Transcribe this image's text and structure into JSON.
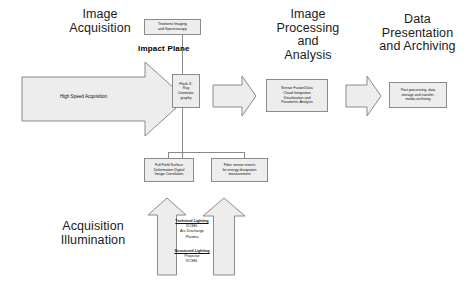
{
  "diagram": {
    "colors": {
      "shape_fill": "#ededed",
      "shape_stroke": "#8a8a8a",
      "text": "#111111",
      "background": "#ffffff"
    },
    "headings": [
      {
        "id": "image-acquisition",
        "lines": [
          "Image",
          "Acquisition"
        ]
      },
      {
        "id": "image-processing-analysis",
        "lines": [
          "Image",
          "Processing",
          "and",
          "Analysis"
        ]
      },
      {
        "id": "data-presentation-archiving",
        "lines": [
          "Data",
          "Presentation",
          "and Archiving"
        ]
      },
      {
        "id": "acquisition-illumination",
        "lines": [
          "Acquisition",
          "Illumination"
        ]
      }
    ],
    "main_arrow": {
      "label": "High Speed Acquisition"
    },
    "impact_plane": {
      "label": "Impact Plane"
    },
    "boxes": [
      {
        "id": "terahertz",
        "lines": [
          "Terahertz Imaging",
          "and Spectroscopy"
        ]
      },
      {
        "id": "flash-xray",
        "lines": [
          "Flash X-",
          "Ray",
          "Cinemato-",
          "graphy"
        ]
      },
      {
        "id": "sensor-fusion",
        "lines": [
          "Sensor Fusion/Data",
          "Cloud Integration",
          "Visualization and",
          "Parametric Analysis"
        ]
      },
      {
        "id": "post-processing",
        "lines": [
          "Post processing, data",
          "storage and transfer,",
          "media archiving"
        ]
      },
      {
        "id": "full-field-dic",
        "lines": [
          "Full Field Surface",
          "Deformation Digital",
          "Image Correlation"
        ]
      },
      {
        "id": "fiber-sensor",
        "lines": [
          "Fiber sensor inserts",
          "for energy dissipation",
          "measurement"
        ]
      }
    ],
    "illumination": {
      "groups": [
        {
          "id": "technical-lighting",
          "heading": "Technical Lighting",
          "items": [
            "VCSEL",
            "Arc Discharge",
            "Plasma"
          ]
        },
        {
          "id": "structured-lighting",
          "heading": "Structured Lighting",
          "items": [
            "Projector",
            "VCSEL"
          ]
        }
      ]
    }
  }
}
